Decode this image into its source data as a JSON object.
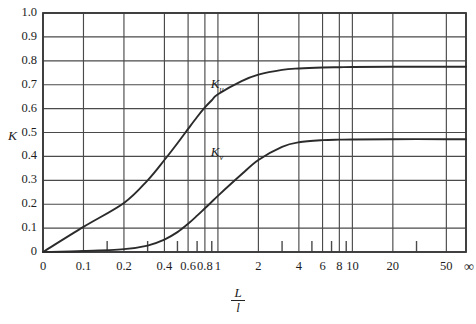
{
  "chart_data": {
    "type": "line",
    "title": "",
    "xlabel": "L/l",
    "xlabel_numerator": "L",
    "xlabel_denominator": "l",
    "ylabel": "K",
    "ylim": [
      0,
      1.0
    ],
    "grid": true,
    "legend_position": "inline-annotations",
    "y_ticks": [
      "0",
      "0.1",
      "0.2",
      "0.3",
      "0.4",
      "0.5",
      "0.6",
      "0.7",
      "0.8",
      "0.9",
      "1.0"
    ],
    "y_tick_values": [
      0,
      0.1,
      0.2,
      0.3,
      0.4,
      0.5,
      0.6,
      0.7,
      0.8,
      0.9,
      1.0
    ],
    "x_ticks": [
      "0",
      "0.1",
      "0.2",
      "0.4",
      "0.6",
      "0.8",
      "1",
      "2",
      "4",
      "6",
      "8",
      "10",
      "20",
      "50",
      "∞"
    ],
    "x_tick_values": [
      0,
      0.1,
      0.2,
      0.4,
      0.6,
      0.8,
      1,
      2,
      4,
      6,
      8,
      10,
      20,
      50,
      1000
    ],
    "x_minor_ticks": [
      0.15,
      0.3,
      0.5,
      0.7,
      0.9,
      3,
      5,
      7,
      9,
      30
    ],
    "x_scale": "log-with-zero-and-infinity",
    "series": [
      {
        "name": "K_u",
        "label": "K",
        "label_subscript": "u",
        "plateau": 0.77,
        "annotation_x": 1.05,
        "annotation_y": 0.7,
        "x": [
          0,
          0.1,
          0.2,
          0.3,
          0.4,
          0.5,
          0.6,
          0.7,
          0.8,
          0.9,
          1.0,
          1.5,
          2,
          3,
          4,
          6,
          8,
          10,
          20,
          50,
          1000
        ],
        "values": [
          0,
          0.105,
          0.205,
          0.3,
          0.385,
          0.455,
          0.515,
          0.565,
          0.605,
          0.635,
          0.66,
          0.715,
          0.742,
          0.762,
          0.768,
          0.772,
          0.773,
          0.774,
          0.775,
          0.775,
          0.775
        ]
      },
      {
        "name": "K_v",
        "label": "K",
        "label_subscript": "v",
        "plateau": 0.47,
        "annotation_x": 1.05,
        "annotation_y": 0.415,
        "x": [
          0,
          0.1,
          0.2,
          0.3,
          0.4,
          0.5,
          0.6,
          0.7,
          0.8,
          0.9,
          1.0,
          1.5,
          2,
          3,
          4,
          6,
          8,
          10,
          20,
          50,
          1000
        ],
        "values": [
          0,
          0.004,
          0.012,
          0.027,
          0.052,
          0.083,
          0.118,
          0.152,
          0.183,
          0.21,
          0.235,
          0.325,
          0.385,
          0.44,
          0.459,
          0.468,
          0.47,
          0.471,
          0.472,
          0.472,
          0.472
        ]
      }
    ]
  },
  "axes": {
    "y_label_text": "K",
    "x_label_numerator": "L",
    "x_label_denominator": "l"
  },
  "annotations": {
    "upper_curve": {
      "base": "K",
      "sub": "u"
    },
    "lower_curve": {
      "base": "K",
      "sub": "v"
    }
  },
  "colors": {
    "background": "#ffffff",
    "axis": "#3a3a3a",
    "grid": "#4a4a4a",
    "curve": "#2b2b2b",
    "text": "#1d1d1d"
  }
}
